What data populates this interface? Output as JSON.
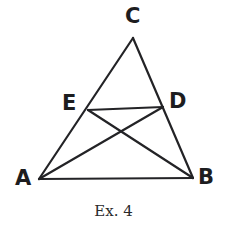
{
  "figure": {
    "caption": "Ex. 4",
    "stroke_color": "#232326",
    "background_color": "#ffffff",
    "label_color": "#1d1d1f",
    "stroke_width": 2.2,
    "width": 227,
    "height": 237,
    "points": [
      {
        "name": "A",
        "label": "A",
        "x": 39,
        "y": 179,
        "label_x": 15,
        "label_y": 168
      },
      {
        "name": "B",
        "label": "B",
        "x": 193,
        "y": 178,
        "label_x": 198,
        "label_y": 167
      },
      {
        "name": "C",
        "label": "C",
        "x": 133,
        "y": 38,
        "label_x": 125,
        "label_y": 6
      },
      {
        "name": "D",
        "label": "D",
        "x": 163,
        "y": 107,
        "label_x": 169,
        "label_y": 91
      },
      {
        "name": "E",
        "label": "E",
        "x": 88,
        "y": 110,
        "label_x": 62,
        "label_y": 93
      }
    ],
    "segments": [
      {
        "name": "side-AB",
        "from": "A",
        "to": "B"
      },
      {
        "name": "side-AC",
        "from": "A",
        "to": "C"
      },
      {
        "name": "side-BC",
        "from": "B",
        "to": "C"
      },
      {
        "name": "cevian-AD",
        "from": "A",
        "to": "D"
      },
      {
        "name": "cevian-BE",
        "from": "B",
        "to": "E"
      },
      {
        "name": "segment-ED",
        "from": "E",
        "to": "D"
      }
    ],
    "intersection": {
      "name": "cevian-intersection",
      "x": 128,
      "y": 133
    }
  }
}
